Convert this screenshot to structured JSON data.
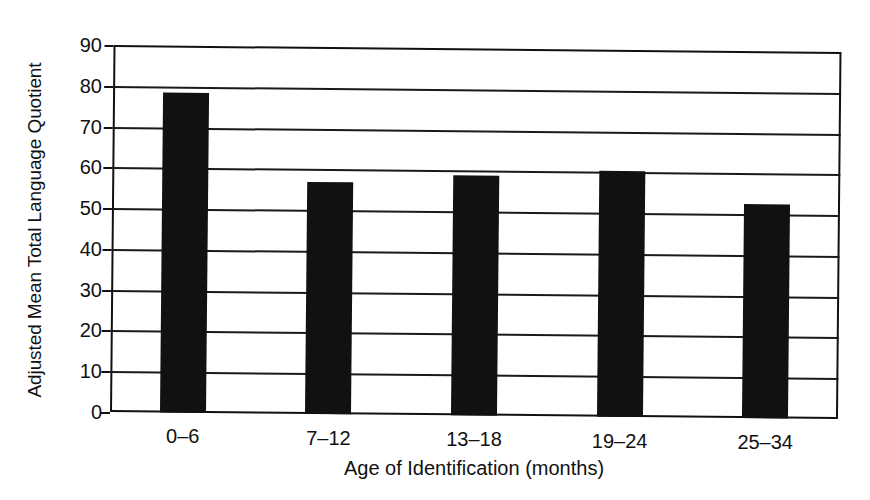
{
  "chart_data": {
    "type": "bar",
    "title": "",
    "xlabel": "Age of Identification (months)",
    "ylabel": "Adjusted Mean Total Language Quotient",
    "categories": [
      "0–6",
      "7–12",
      "13–18",
      "19–24",
      "25–34"
    ],
    "values": [
      78.5,
      57.0,
      58.8,
      60.3,
      52.5
    ],
    "ylim": [
      0,
      90
    ],
    "yticks": [
      0,
      10,
      20,
      30,
      40,
      50,
      60,
      70,
      80,
      90
    ],
    "ytick_labels": [
      "0",
      "10",
      "20",
      "30",
      "40",
      "50",
      "60",
      "70",
      "80",
      "90"
    ],
    "grid": true,
    "grid_axis": "y",
    "legend": null,
    "bar_color": "#111111",
    "frame_color": "#111111",
    "background": "#ffffff"
  }
}
